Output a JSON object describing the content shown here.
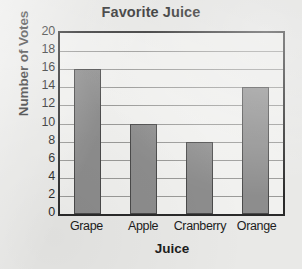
{
  "chart_data": {
    "type": "bar",
    "title": "Favorite Juice",
    "xlabel": "Juice",
    "ylabel": "Number of Votes",
    "categories": [
      "Grape",
      "Apple",
      "Cranberry",
      "Orange"
    ],
    "values": [
      16,
      10,
      8,
      14
    ],
    "ylim": [
      0,
      20
    ],
    "ytick_step": 2,
    "yticks": [
      20,
      18,
      16,
      14,
      12,
      10,
      8,
      6,
      4,
      2,
      0
    ],
    "grid": "horizontal",
    "legend": "none",
    "colors": {
      "bar_fill": "#8d8d8d",
      "bar_border": "#4a4a4a",
      "plot_background": "#f1f1ef",
      "page_background": "#e9e9e7",
      "axis_border": "#2a2a2a",
      "gridline": "#9a9a98",
      "text": "#1d1d1d"
    }
  }
}
